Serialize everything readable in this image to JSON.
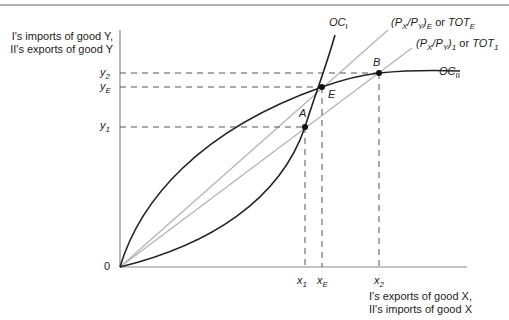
{
  "diagram": {
    "y_axis_label": [
      "I's imports of good Y,",
      "II's exports of good Y"
    ],
    "x_axis_label": [
      "I's exports of good X,",
      "II's imports of good X"
    ],
    "origin_label": "0",
    "y_ticks": [
      {
        "name": "y2",
        "base": "y",
        "sub": "2"
      },
      {
        "name": "yE",
        "base": "y",
        "sub": "E"
      },
      {
        "name": "y1",
        "base": "y",
        "sub": "1"
      }
    ],
    "x_ticks": [
      {
        "name": "x1",
        "base": "x",
        "sub": "1"
      },
      {
        "name": "xE",
        "base": "x",
        "sub": "E"
      },
      {
        "name": "x2",
        "base": "x",
        "sub": "2"
      }
    ],
    "curves": {
      "oc1": {
        "base": "OC",
        "sub": "I"
      },
      "oc2": {
        "base": "OC",
        "sub": "II"
      },
      "tot_e": {
        "text_a": "(P",
        "sub_x": "X",
        "mid": "/P",
        "sub_y": "Y",
        "close": ")",
        "sub_e": "E",
        "or": " or ",
        "tot": "TOT",
        "sub_tot": "E"
      },
      "tot_1": {
        "text_a": "(P",
        "sub_x": "X",
        "mid": "/P",
        "sub_y": "Y",
        "close": ")",
        "sub_e": "1",
        "or": " or ",
        "tot": "TOT",
        "sub_tot": "1"
      }
    },
    "points": {
      "A": "A",
      "B": "B",
      "E": "E"
    },
    "colors": {
      "curve": "#222222",
      "tot_line": "#b0b0b0",
      "axis": "#888888",
      "dash": "#555555"
    }
  }
}
